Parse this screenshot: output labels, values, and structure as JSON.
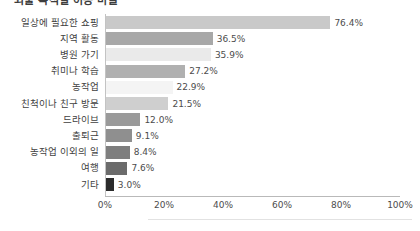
{
  "chart_data": {
    "type": "bar",
    "orientation": "horizontal",
    "title": "외출 목적별 이동 비율",
    "xlabel": "",
    "ylabel": "",
    "xlim": [
      0,
      100
    ],
    "grid": false,
    "legend": null,
    "value_suffix": "%",
    "xticks": [
      "0%",
      "20%",
      "40%",
      "60%",
      "80%",
      "100%"
    ],
    "xtick_values": [
      0,
      20,
      40,
      60,
      80,
      100
    ],
    "categories": [
      "일상에 필요한 쇼핑",
      "지역 활동",
      "병원 가기",
      "취미나 학습",
      "농작업",
      "친척이나 친구 방문",
      "드라이브",
      "출퇴근",
      "농작업 이외의 일",
      "여행",
      "기타"
    ],
    "values": [
      76.4,
      36.5,
      35.9,
      27.2,
      22.9,
      21.5,
      12.0,
      9.1,
      8.4,
      7.6,
      3.0
    ],
    "data_labels": [
      "76.4%",
      "36.5%",
      "35.9%",
      "27.2%",
      "22.9%",
      "21.5%",
      "12.0%",
      "9.1%",
      "8.4%",
      "7.6%",
      "3.0%"
    ],
    "bar_colors": [
      "#c9c9c9",
      "#a8a8a8",
      "#eaeaea",
      "#b0b0b0",
      "#f4f4f4",
      "#cfcfcf",
      "#9a9a9a",
      "#8f8f8f",
      "#7e7e7e",
      "#6b6b6b",
      "#2b2b2b"
    ]
  }
}
